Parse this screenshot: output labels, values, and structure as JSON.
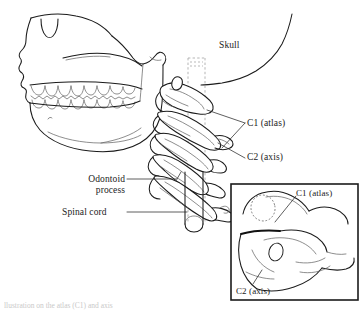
{
  "figure": {
    "background_color": "#ffffff",
    "line_color": "#1b1b1b",
    "secondary_line_color": "#6e6e6e",
    "dashed_guide_color": "#9a9a9a",
    "label_color": "#1b1b1b"
  },
  "labels": {
    "skull": "Skull",
    "c1_atlas": "C1 (atlas)",
    "c2_axis": "C2 (axis)",
    "odontoid_process": "Odontoid process",
    "spinal_cord": "Spinal cord"
  },
  "inset": {
    "border_color": "#1b1b1b",
    "labels": {
      "c1_atlas": "C1 (atlas)",
      "c2_axis": "C2 (axis)"
    }
  },
  "caption": {
    "text": "llustration on the atlas (C1) and axis"
  },
  "structures": [
    {
      "name": "skull-profile",
      "description": "lateral view of cranium and facial bones"
    },
    {
      "name": "nasal-aperture",
      "description": "piriform aperture notch"
    },
    {
      "name": "maxillary-teeth",
      "description": "upper dental arch"
    },
    {
      "name": "mandibular-teeth",
      "description": "lower dental arch"
    },
    {
      "name": "mandible",
      "description": "lower jaw with ramus and condyle"
    },
    {
      "name": "occipital-curve",
      "description": "posterior skull outline"
    },
    {
      "name": "cervical-vertebrae",
      "description": "stacked cervical vertebral bodies C1-C5"
    },
    {
      "name": "atlas-c1",
      "description": "first cervical vertebra"
    },
    {
      "name": "axis-c2",
      "description": "second cervical vertebra with odontoid peg"
    },
    {
      "name": "spinal-cord-cylinder",
      "description": "cylindrical representation of spinal cord within canal"
    },
    {
      "name": "spinal-canal-guides",
      "description": "vertical dashed lines marking spinal canal"
    },
    {
      "name": "inset-detail",
      "description": "magnified superior-oblique view of C1 and C2 articulation"
    }
  ]
}
